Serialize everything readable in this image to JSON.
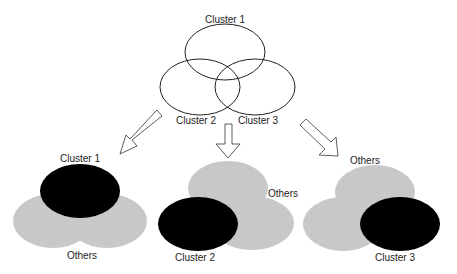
{
  "top_venn": {
    "labels": {
      "cluster1": "Cluster 1",
      "cluster2": "Cluster 2",
      "cluster3": "Cluster 3"
    }
  },
  "panels": [
    {
      "highlight": "Cluster 1",
      "others": "Others"
    },
    {
      "highlight": "Cluster 2",
      "others": "Others"
    },
    {
      "highlight": "Cluster 3",
      "others": "Others"
    }
  ],
  "colors": {
    "highlight": "#000000",
    "others": "#c8c8c8",
    "outline": "#222222",
    "background": "#ffffff"
  }
}
